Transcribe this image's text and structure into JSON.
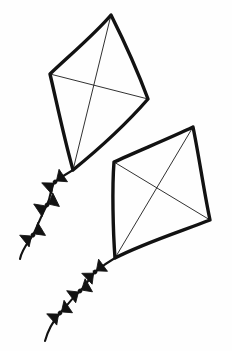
{
  "artwork": {
    "title": "Two Kites",
    "description": "Black ink line drawing of two diamond kites with wavy tails and bow ties",
    "style": "hand-drawn ink sketch",
    "background_color": "#fefefe",
    "ink_color": "#121212",
    "canvas": {
      "width": 232,
      "height": 351
    }
  },
  "kites": [
    {
      "id": "upper-kite",
      "name": "Upper Kite",
      "vertices": {
        "top": {
          "x": 111,
          "y": 15
        },
        "left": {
          "x": 50,
          "y": 74
        },
        "right": {
          "x": 148,
          "y": 99
        },
        "bottom": {
          "x": 73,
          "y": 170
        }
      },
      "frame_path": "M111,15 C96,33 70,55 50,74 C57,104 64,138 73,170 C100,148 128,122 148,99 C138,72 124,41 111,15 Z",
      "frame_stroke_width": 3.4,
      "spars": [
        {
          "name": "vertical-spar",
          "path": "M111,15 L73,170"
        },
        {
          "name": "horizontal-spar",
          "path": "M50,74 L148,99"
        }
      ]
    },
    {
      "id": "lower-kite",
      "name": "Lower Kite",
      "vertices": {
        "top": {
          "x": 193,
          "y": 127
        },
        "left": {
          "x": 114,
          "y": 162
        },
        "right": {
          "x": 210,
          "y": 220
        },
        "bottom": {
          "x": 115,
          "y": 258
        }
      },
      "frame_path": "M193,127 C170,138 138,151 114,162 C112,188 113,231 115,258 C144,243 182,231 210,220 C204,192 199,156 193,127 Z",
      "frame_stroke_width": 3.4,
      "spars": [
        {
          "name": "vertical-spar",
          "path": "M193,127 L115,258"
        },
        {
          "name": "horizontal-spar",
          "path": "M114,162 L210,220"
        }
      ]
    }
  ],
  "tails": [
    {
      "id": "upper-tail",
      "name": "Upper Kite Tail",
      "attached_to": "upper-kite",
      "string_path": "M73,170 C66,174 60,178 55,182 C50,187 52,194 47,205 C42,214 37,227 33,235 C28,243 22,249 20,259",
      "bows": [
        {
          "name": "bow-1",
          "cx": 55,
          "cy": 182,
          "rx": 11,
          "ry": 7.5,
          "rotate": -38
        },
        {
          "name": "bow-2",
          "cx": 47,
          "cy": 205,
          "rx": 11,
          "ry": 7.5,
          "rotate": -30
        },
        {
          "name": "bow-3",
          "cx": 33,
          "cy": 235,
          "rx": 11,
          "ry": 7.5,
          "rotate": -35
        }
      ]
    },
    {
      "id": "lower-tail",
      "name": "Lower Kite Tail",
      "attached_to": "lower-kite",
      "string_path": "M115,258 C108,262 101,267 95,272 C89,278 86,286 80,291 C73,297 66,307 60,313 C54,320 48,330 45,341",
      "bows": [
        {
          "name": "bow-4",
          "cx": 95,
          "cy": 272,
          "rx": 11,
          "ry": 7.5,
          "rotate": -40
        },
        {
          "name": "bow-5",
          "cx": 80,
          "cy": 291,
          "rx": 11,
          "ry": 7.5,
          "rotate": -33
        },
        {
          "name": "bow-6",
          "cx": 60,
          "cy": 313,
          "rx": 11,
          "ry": 7.5,
          "rotate": -38
        }
      ]
    }
  ]
}
